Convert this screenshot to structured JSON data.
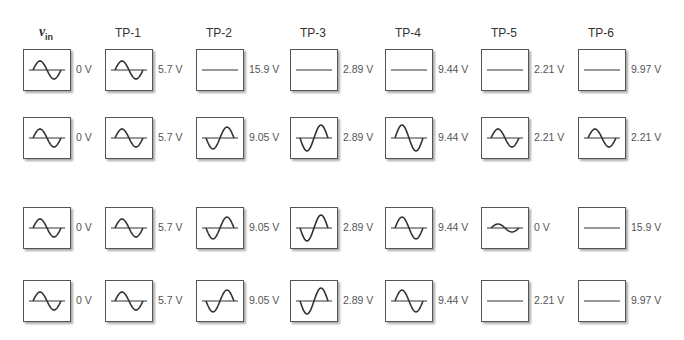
{
  "headers": [
    "v",
    "TP-1",
    "TP-2",
    "TP-3",
    "TP-4",
    "TP-5",
    "TP-6"
  ],
  "vin_sub": "in",
  "rows": [
    [
      {
        "wave": "sine",
        "amp": 9,
        "value": "0 V"
      },
      {
        "wave": "sine",
        "amp": 9,
        "value": "5.7 V"
      },
      {
        "wave": "flat",
        "amp": 0,
        "value": "15.9 V"
      },
      {
        "wave": "flat",
        "amp": 0,
        "value": "2.89 V"
      },
      {
        "wave": "flat",
        "amp": 0,
        "value": "9.44 V"
      },
      {
        "wave": "flat",
        "amp": 0,
        "value": "2.21 V"
      },
      {
        "wave": "flat",
        "amp": 0,
        "value": "9.97 V"
      }
    ],
    [
      {
        "wave": "sine",
        "amp": 9,
        "value": "0 V"
      },
      {
        "wave": "sine",
        "amp": 9,
        "value": "5.7 V"
      },
      {
        "wave": "inverted",
        "amp": 11,
        "value": "9.05 V"
      },
      {
        "wave": "inverted",
        "amp": 13,
        "value": "2.89 V"
      },
      {
        "wave": "sine",
        "amp": 13,
        "value": "9.44 V"
      },
      {
        "wave": "sine",
        "amp": 9,
        "value": "2.21 V"
      },
      {
        "wave": "sine",
        "amp": 9,
        "value": "2.21 V"
      }
    ],
    [
      {
        "wave": "sine",
        "amp": 9,
        "value": "0 V"
      },
      {
        "wave": "sine",
        "amp": 9,
        "value": "5.7 V"
      },
      {
        "wave": "inverted",
        "amp": 11,
        "value": "9.05 V"
      },
      {
        "wave": "inverted",
        "amp": 13,
        "value": "2.89 V"
      },
      {
        "wave": "sine",
        "amp": 11,
        "value": "9.44 V"
      },
      {
        "wave": "sine",
        "amp": 4,
        "value": "0 V"
      },
      {
        "wave": "flat",
        "amp": 0,
        "value": "15.9 V"
      }
    ],
    [
      {
        "wave": "sine",
        "amp": 9,
        "value": "0 V"
      },
      {
        "wave": "sine",
        "amp": 9,
        "value": "5.7 V"
      },
      {
        "wave": "inverted",
        "amp": 11,
        "value": "9.05 V"
      },
      {
        "wave": "inverted",
        "amp": 13,
        "value": "2.89 V"
      },
      {
        "wave": "sine",
        "amp": 11,
        "value": "9.44 V"
      },
      {
        "wave": "flat",
        "amp": 0,
        "value": "2.21 V"
      },
      {
        "wave": "flat",
        "amp": 0,
        "value": "9.97 V"
      }
    ]
  ],
  "colors": {
    "trace": "#333333",
    "border": "#555555",
    "text": "#555555"
  }
}
